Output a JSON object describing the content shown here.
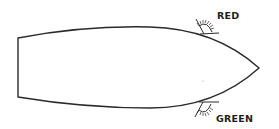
{
  "diagram": {
    "labels": {
      "port_light": "RED",
      "starboard_light": "GREEN"
    },
    "colors": {
      "line": "#2a2a2a",
      "text": "#1e1e1e",
      "background": "#ffffff"
    }
  }
}
